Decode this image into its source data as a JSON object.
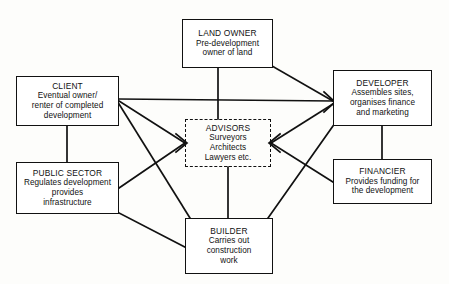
{
  "diagram": {
    "line_color": "#111111",
    "box_border_color": "#111111",
    "background_color": "#fdfdfb",
    "nodes": [
      {
        "id": "land-owner",
        "title": "LAND OWNER",
        "description": "Pre-development\nowner of land",
        "border": "solid"
      },
      {
        "id": "client",
        "title": "CLIENT",
        "description": "Eventual owner/\nrenter of completed\ndevelopment",
        "border": "solid"
      },
      {
        "id": "developer",
        "title": "DEVELOPER",
        "description": "Assembles sites,\norganises finance\nand marketing",
        "border": "solid"
      },
      {
        "id": "advisors",
        "title": "ADVISORS",
        "description": "Surveyors\nArchitects\nLawyers etc.",
        "border": "dashed"
      },
      {
        "id": "public-sector",
        "title": "PUBLIC SECTOR",
        "description": "Regulates development\nprovides\ninfrastructure",
        "border": "solid"
      },
      {
        "id": "financier",
        "title": "FINANCIER",
        "description": "Provides funding for\nthe development",
        "border": "solid"
      },
      {
        "id": "builder",
        "title": "BUILDER",
        "description": "Carries out\nconstruction\nwork",
        "border": "solid"
      }
    ],
    "edges": [
      {
        "from": "land-owner",
        "to": "advisors",
        "style": "vertical"
      },
      {
        "from": "land-owner",
        "to": "developer",
        "style": "diagonal"
      },
      {
        "from": "client",
        "to": "developer",
        "style": "horizontal"
      },
      {
        "from": "client",
        "to": "advisors",
        "style": "diagonal"
      },
      {
        "from": "client",
        "to": "builder",
        "style": "diagonal"
      },
      {
        "from": "client",
        "to": "public-sector",
        "style": "vertical"
      },
      {
        "from": "public-sector",
        "to": "advisors",
        "style": "diagonal"
      },
      {
        "from": "public-sector",
        "to": "builder",
        "style": "diagonal"
      },
      {
        "from": "advisors",
        "to": "developer",
        "style": "diagonal"
      },
      {
        "from": "advisors",
        "to": "financier",
        "style": "diagonal"
      },
      {
        "from": "advisors",
        "to": "builder",
        "style": "vertical"
      },
      {
        "from": "developer",
        "to": "financier",
        "style": "vertical"
      },
      {
        "from": "developer",
        "to": "builder",
        "style": "diagonal"
      }
    ]
  }
}
